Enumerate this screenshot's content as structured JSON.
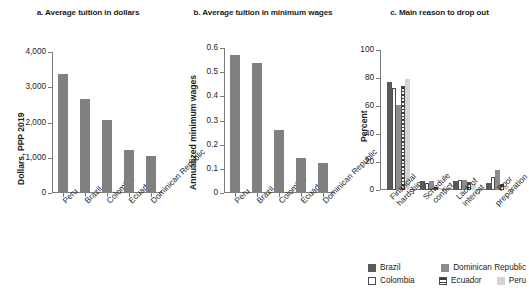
{
  "chart_data": [
    {
      "id": "a",
      "type": "bar",
      "title": "a. Average tuition in dollars",
      "xlabel": "",
      "ylabel": "Dollars, PPP 2019",
      "categories": [
        "Peru",
        "Brazil",
        "Colombia",
        "Ecuador",
        "Dominican Republic"
      ],
      "values": [
        3380,
        2680,
        2060,
        1210,
        1060
      ],
      "ylim": [
        0,
        4000
      ],
      "yticks": [
        0,
        1000,
        2000,
        3000,
        4000
      ],
      "ytick_labels": [
        "0",
        "1,000",
        "2,000",
        "3,000",
        "4,000"
      ],
      "grid": false,
      "legend": "none",
      "bar_color": "#808080"
    },
    {
      "id": "b",
      "type": "bar",
      "title": "b. Average tuition in minimum wages",
      "xlabel": "",
      "ylabel": "Annualized minimum wages",
      "categories": [
        "Peru",
        "Brazil",
        "Colombia",
        "Ecuador",
        "Dominican Republic"
      ],
      "values": [
        0.57,
        0.54,
        0.26,
        0.145,
        0.125
      ],
      "ylim": [
        0,
        0.6
      ],
      "yticks": [
        0,
        0.1,
        0.2,
        0.3,
        0.4,
        0.5,
        0.6
      ],
      "ytick_labels": [
        "0",
        "0.1",
        "0.2",
        "0.3",
        "0.4",
        "0.5",
        "0.6"
      ],
      "grid": false,
      "legend": "none",
      "bar_color": "#808080"
    },
    {
      "id": "c",
      "type": "bar",
      "title": "c. Main reason to drop out",
      "xlabel": "",
      "ylabel": "Percent",
      "categories": [
        [
          "Financial",
          "hardship"
        ],
        [
          "Schedule",
          "conflict"
        ],
        [
          "Lack of",
          "interest"
        ],
        [
          "Poor",
          "preparation"
        ]
      ],
      "series": [
        {
          "name": "Brazil",
          "color": "#595959",
          "pattern": "solid",
          "values": [
            77,
            6.5,
            6.5,
            5
          ]
        },
        {
          "name": "Colombia",
          "color": "#ffffff",
          "pattern": "outline",
          "values": [
            73,
            5,
            7.5,
            9
          ]
        },
        {
          "name": "Dominican Republic",
          "color": "#8c8c8c",
          "pattern": "solid",
          "values": [
            61,
            6.5,
            7,
            14
          ]
        },
        {
          "name": "Ecuador",
          "color": "#ffffff",
          "pattern": "horizontal-hatch",
          "values": [
            74,
            2.5,
            5.5,
            4
          ]
        },
        {
          "name": "Peru",
          "color": "#d4d4d4",
          "pattern": "solid",
          "values": [
            79,
            1.5,
            4.5,
            3
          ]
        }
      ],
      "ylim": [
        0,
        100
      ],
      "yticks": [
        0,
        20,
        40,
        60,
        80,
        100
      ],
      "ytick_labels": [
        "0",
        "20",
        "40",
        "60",
        "80",
        "100"
      ],
      "grid": false,
      "legend": "bottom"
    }
  ],
  "legend": {
    "items": [
      {
        "label": "Brazil"
      },
      {
        "label": "Dominican Republic"
      },
      {
        "label": "Colombia"
      },
      {
        "label": "Ecuador"
      },
      {
        "label": "Peru"
      }
    ]
  }
}
